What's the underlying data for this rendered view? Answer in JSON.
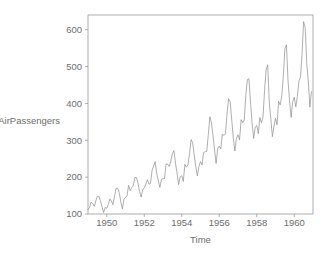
{
  "chart_data": {
    "type": "line",
    "title": "",
    "xlabel": "Time",
    "ylabel": "AirPassengers",
    "xlim": [
      1949.0,
      1961.0
    ],
    "ylim": [
      100,
      640
    ],
    "grid": false,
    "legend": null,
    "x_ticks": [
      1950,
      1952,
      1954,
      1956,
      1958,
      1960
    ],
    "x_tick_labels": [
      "1950",
      "1952",
      "1954",
      "1956",
      "1958",
      "1960"
    ],
    "y_ticks": [
      100,
      200,
      300,
      400,
      500,
      600
    ],
    "y_tick_labels": [
      "100",
      "200",
      "300",
      "400",
      "500",
      "600"
    ],
    "series": [
      {
        "name": "AirPassengers",
        "color": "#8d8d8d",
        "x_start": 1949.0,
        "x_step": 0.0833333,
        "values": [
          112,
          118,
          132,
          129,
          121,
          135,
          148,
          148,
          136,
          119,
          104,
          118,
          115,
          126,
          141,
          135,
          125,
          149,
          170,
          170,
          158,
          133,
          114,
          140,
          145,
          150,
          178,
          163,
          172,
          178,
          199,
          199,
          184,
          162,
          146,
          166,
          171,
          180,
          193,
          181,
          183,
          218,
          230,
          242,
          209,
          191,
          172,
          194,
          196,
          196,
          236,
          235,
          229,
          243,
          264,
          272,
          237,
          211,
          180,
          201,
          204,
          188,
          235,
          227,
          234,
          264,
          302,
          293,
          259,
          229,
          203,
          229,
          242,
          233,
          267,
          269,
          270,
          315,
          364,
          347,
          312,
          274,
          237,
          278,
          284,
          277,
          317,
          313,
          318,
          374,
          413,
          405,
          355,
          306,
          271,
          306,
          315,
          301,
          356,
          348,
          355,
          422,
          465,
          467,
          404,
          347,
          305,
          336,
          340,
          318,
          362,
          348,
          363,
          435,
          491,
          505,
          404,
          359,
          310,
          337,
          360,
          342,
          406,
          396,
          420,
          472,
          548,
          559,
          463,
          407,
          362,
          405,
          417,
          391,
          419,
          461,
          472,
          535,
          622,
          606,
          508,
          461,
          390,
          432
        ]
      }
    ]
  },
  "plot_geometry": {
    "box_left": 88,
    "box_top": 15,
    "box_right": 313,
    "box_bottom": 214,
    "tick_length": 3,
    "frame_color": "#9a9a9a",
    "text_color": "#6e6e6e",
    "background": "#ffffff"
  }
}
